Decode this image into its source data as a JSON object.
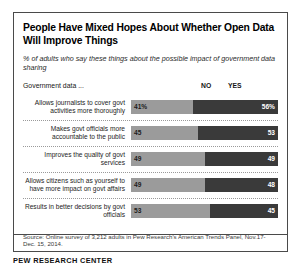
{
  "figure": {
    "title": "People Have Mixed Hopes About Whether Open Data Will Improve Things",
    "subtitle": "% of adults who say these things about the possible impact of government data sharing",
    "stub_header": "Government data ...",
    "source": "Source: Online survey of 3,212 adults in Pew Research's American Trends Panel, Nov.17-Dec. 15, 2014.",
    "brand": "PEW RESEARCH CENTER"
  },
  "colors": {
    "no": "#9b9b9b",
    "yes": "#3a3a3a",
    "border": "#4a4a4a",
    "text": "#000000"
  },
  "chart_data": {
    "type": "bar",
    "orientation": "horizontal",
    "stacked": true,
    "title": "People Have Mixed Hopes About Whether Open Data Will Improve Things",
    "subtitle": "% of adults who say these things about the possible impact of government data sharing",
    "xlabel": "",
    "ylabel": "",
    "xlim": [
      0,
      100
    ],
    "grid": false,
    "legend_position": "top-right",
    "legend": [
      "NO",
      "YES"
    ],
    "categories": [
      "Allows journalists to cover govt activities more thoroughly",
      "Makes govt officials more accountable to the public",
      "Improves the quality of govt services",
      "Allows citizens such as yourself to have more impact on govt affairs",
      "Results in better decisions by govt officials"
    ],
    "series": [
      {
        "name": "NO",
        "values": [
          41,
          45,
          49,
          49,
          53
        ]
      },
      {
        "name": "YES",
        "values": [
          56,
          53,
          49,
          48,
          45
        ]
      }
    ],
    "data_labels": {
      "NO": [
        "41%",
        "45",
        "49",
        "49",
        "53"
      ],
      "YES": [
        "56%",
        "53",
        "49",
        "48",
        "45"
      ]
    }
  },
  "rows": [
    {
      "label": "Allows journalists to cover govt activities more thoroughly",
      "no": 41,
      "yes": 56,
      "no_label": "41%",
      "yes_label": "56%"
    },
    {
      "label": "Makes govt officials more accountable to the public",
      "no": 45,
      "yes": 53,
      "no_label": "45",
      "yes_label": "53"
    },
    {
      "label": "Improves the quality of govt services",
      "no": 49,
      "yes": 49,
      "no_label": "49",
      "yes_label": "49"
    },
    {
      "label": "Allows citizens such as yourself to have more impact on govt affairs",
      "no": 49,
      "yes": 48,
      "no_label": "49",
      "yes_label": "48"
    },
    {
      "label": "Results in better decisions by govt officials",
      "no": 53,
      "yes": 45,
      "no_label": "53",
      "yes_label": "45"
    }
  ],
  "headers": {
    "no": "NO",
    "yes": "YES"
  }
}
